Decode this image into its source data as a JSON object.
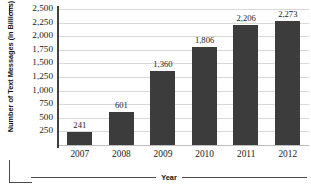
{
  "chart_data": {
    "type": "bar",
    "title": "",
    "subtitle": "",
    "xlabel": "Year",
    "ylabel": "Number of Text Messages (in Billions)",
    "categories": [
      "2007",
      "2008",
      "2009",
      "2010",
      "2011",
      "2012"
    ],
    "values": [
      241,
      601,
      1360,
      1806,
      2206,
      2273
    ],
    "value_labels": [
      "241",
      "601",
      "1,360",
      "1,806",
      "2,206",
      "2,273"
    ],
    "ylim": [
      0,
      2500
    ],
    "ytick_values": [
      2500,
      2250,
      2000,
      1750,
      1500,
      1250,
      1000,
      750,
      500,
      250
    ],
    "ytick_labels": [
      "2,500",
      "2,250",
      "2,000",
      "1,750",
      "1,500",
      "1,250",
      "1,000",
      "750",
      "500",
      "250"
    ],
    "grid": true,
    "legend": null,
    "bar_color": "#3c3c3c",
    "gridline_color": "#d8d8d8",
    "axis_color": "#3f3f3f",
    "text_color": "#1a1a1a"
  }
}
